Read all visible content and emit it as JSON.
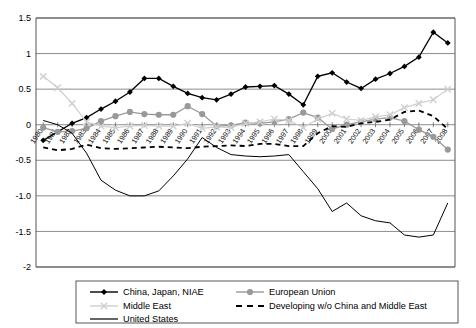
{
  "chart_data": {
    "type": "line",
    "title": "",
    "xlabel": "",
    "ylabel": "",
    "ylim": [
      -2,
      1.5
    ],
    "yticks": [
      "1.5",
      "1",
      "0.5",
      "0",
      "-0.5",
      "-1.0",
      "-1.5",
      "-2"
    ],
    "ytick_values": [
      1.5,
      1,
      0.5,
      0,
      -0.5,
      -1.0,
      -1.5,
      -2
    ],
    "grid": true,
    "legend_position": "bottom",
    "categories": [
      "1980",
      "1981",
      "1982",
      "1983",
      "1984",
      "1985",
      "1986",
      "1987",
      "1988",
      "1989",
      "1990",
      "1991",
      "1992",
      "1993",
      "1994",
      "1995",
      "1996",
      "1997",
      "1998",
      "1999",
      "2000",
      "2001",
      "2002",
      "2003",
      "2004",
      "2005",
      "2006",
      "2007",
      "2008"
    ],
    "series": [
      {
        "name": "China, Japan, NIAE",
        "color": "#000000",
        "marker": "diamond",
        "style": "solid",
        "values": [
          -0.22,
          -0.1,
          0.02,
          0.1,
          0.22,
          0.33,
          0.46,
          0.65,
          0.65,
          0.54,
          0.44,
          0.38,
          0.35,
          0.43,
          0.53,
          0.54,
          0.55,
          0.43,
          0.28,
          0.68,
          0.73,
          0.6,
          0.51,
          0.64,
          0.72,
          0.82,
          0.95,
          1.3,
          1.15
        ]
      },
      {
        "name": "European Union",
        "color": "#999999",
        "marker": "circle",
        "style": "solid",
        "values": [
          -0.04,
          -0.1,
          -0.09,
          -0.05,
          0.05,
          0.12,
          0.18,
          0.15,
          0.14,
          0.14,
          0.26,
          0.15,
          -0.02,
          -0.01,
          0.03,
          0.02,
          0.04,
          0.08,
          0.17,
          0.1,
          -0.06,
          0.0,
          0.04,
          0.08,
          0.1,
          0.05,
          -0.07,
          -0.17,
          -0.35
        ]
      },
      {
        "name": "Middle East",
        "color": "#cfcfcf",
        "marker": "x",
        "style": "solid",
        "values": [
          0.68,
          0.52,
          0.3,
          0.04,
          -0.02,
          -0.04,
          -0.02,
          -0.01,
          -0.02,
          -0.02,
          0.02,
          -0.05,
          -0.03,
          -0.04,
          0.02,
          0.04,
          0.08,
          0.06,
          -0.04,
          0.08,
          0.16,
          0.08,
          0.06,
          0.11,
          0.14,
          0.24,
          0.3,
          0.35,
          0.5
        ]
      },
      {
        "name": "Developing w/o China and Middle East",
        "color": "#000000",
        "marker": "none",
        "style": "dashed",
        "values": [
          -0.32,
          -0.36,
          -0.34,
          -0.28,
          -0.33,
          -0.34,
          -0.33,
          -0.32,
          -0.31,
          -0.32,
          -0.33,
          -0.31,
          -0.3,
          -0.29,
          -0.3,
          -0.27,
          -0.27,
          -0.3,
          -0.3,
          -0.12,
          -0.02,
          -0.03,
          0.02,
          0.04,
          0.07,
          0.18,
          0.2,
          0.12,
          -0.06
        ]
      },
      {
        "name": "United States",
        "color": "#000000",
        "marker": "none",
        "style": "solid",
        "values": [
          0.06,
          0.0,
          -0.12,
          -0.4,
          -0.78,
          -0.92,
          -1.0,
          -1.0,
          -0.93,
          -0.72,
          -0.48,
          -0.18,
          -0.32,
          -0.42,
          -0.44,
          -0.45,
          -0.44,
          -0.42,
          -0.66,
          -0.9,
          -1.22,
          -1.1,
          -1.28,
          -1.35,
          -1.38,
          -1.55,
          -1.58,
          -1.55,
          -1.1
        ]
      }
    ]
  },
  "legend": {
    "items": [
      {
        "label": "China, Japan, NIAE",
        "key": "china-japan-niae"
      },
      {
        "label": "European Union",
        "key": "european-union"
      },
      {
        "label": "Middle East",
        "key": "middle-east"
      },
      {
        "label": "Developing w/o China and Middle East",
        "key": "developing"
      },
      {
        "label": "United States",
        "key": "united-states"
      }
    ]
  }
}
